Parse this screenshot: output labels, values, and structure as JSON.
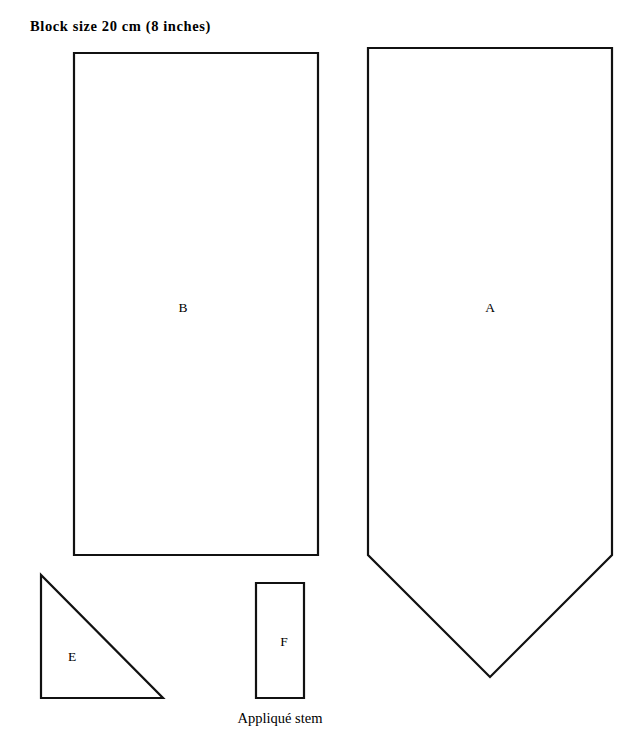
{
  "document": {
    "title": "Block size 20 cm (8 inches)",
    "background_color": "#ffffff",
    "ink_color": "#111111",
    "width": 636,
    "height": 755
  },
  "pieces": [
    {
      "id": "A",
      "label": "A",
      "shape": "pentagon-point-down",
      "points": "368,48 612,48 612,555 490,677 368,555",
      "label_x": 490,
      "label_y": 308
    },
    {
      "id": "B",
      "label": "B",
      "shape": "rectangle",
      "points": "74,53 318,53 318,555 74,555",
      "label_x": 183,
      "label_y": 308
    },
    {
      "id": "E",
      "label": "E",
      "shape": "right-triangle",
      "points": "41,575 41,698 163,698",
      "label_x": 72,
      "label_y": 657
    },
    {
      "id": "F",
      "label": "F",
      "shape": "rectangle",
      "points": "256,583 304,583 304,698 256,698",
      "label_x": 284,
      "label_y": 642
    }
  ],
  "captions": [
    {
      "id": "applique-stem",
      "text": "Appliqué stem",
      "for_piece": "F"
    }
  ]
}
